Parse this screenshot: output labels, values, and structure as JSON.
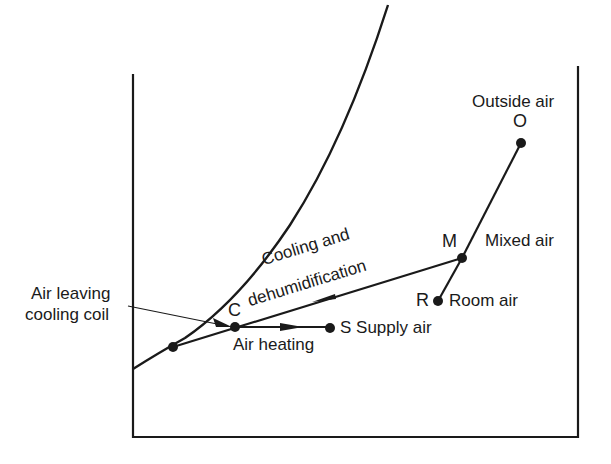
{
  "diagram": {
    "title": "",
    "type": "psychrometric-process-diagram",
    "points": {
      "O": {
        "letter": "O",
        "label": "Outside air"
      },
      "M": {
        "letter": "M",
        "label": "Mixed air"
      },
      "R": {
        "letter": "R",
        "label": "Room air"
      },
      "C": {
        "letter": "C",
        "label_line1": "Air leaving",
        "label_line2": "cooling coil"
      },
      "S": {
        "letter": "S",
        "label": "Supply air"
      }
    },
    "processes": {
      "cooling_line1": "Cooling and",
      "cooling_line2": "dehumidification",
      "heating": "Air heating"
    },
    "colors": {
      "ink": "#1a1a1a",
      "background": "#ffffff"
    }
  }
}
